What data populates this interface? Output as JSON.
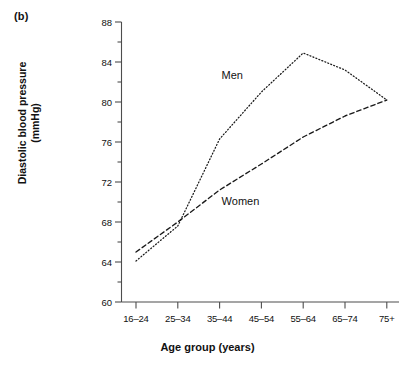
{
  "figure": {
    "panel_label": "(b)",
    "xlabel": "Age group (years)",
    "ylabel_line1": "Diastolic blood pressure",
    "ylabel_line2": "(mmHg)",
    "line_color": "#1a1a1a",
    "axis_color": "#4d4d4d"
  },
  "chart_data": {
    "type": "line",
    "title": "",
    "subtitle": "",
    "xlabel": "Age group (years)",
    "ylabel": "Diastolic blood pressure (mmHg)",
    "categories": [
      "16–24",
      "25–34",
      "35–44",
      "45–54",
      "55–64",
      "65–74",
      "75+"
    ],
    "ylim": [
      60,
      88
    ],
    "yticks_major": [
      60,
      64,
      68,
      72,
      76,
      80,
      84,
      88
    ],
    "yticks_minor": [
      62,
      66,
      70,
      74,
      78,
      82,
      86
    ],
    "grid": false,
    "legend": "inline-annotations",
    "series": [
      {
        "name": "Men",
        "style": "dotted",
        "values": [
          64.1,
          67.6,
          76.3,
          81.0,
          84.9,
          83.2,
          80.2
        ],
        "label_x_category": "35–44",
        "label_y": 82.6
      },
      {
        "name": "Women",
        "style": "dashed",
        "values": [
          65.0,
          68.0,
          71.2,
          73.8,
          76.5,
          78.6,
          80.2
        ],
        "label_x_category": "35–44",
        "label_y": 70.0
      }
    ],
    "annotations": [
      {
        "text": "Men",
        "value_ref": "men-series-label"
      },
      {
        "text": "Women",
        "value_ref": "women-series-label"
      }
    ]
  }
}
